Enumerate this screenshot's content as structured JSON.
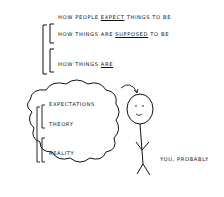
{
  "top_list": {
    "line1": {
      "pre": "How people ",
      "em": "expect",
      "post": " things to be"
    },
    "line2": {
      "pre": "How things are ",
      "em": "supposed",
      "post": " to be"
    },
    "line3": {
      "pre": "How things ",
      "em": "are",
      "post": ""
    }
  },
  "cloud_list": [
    "Expectations",
    "Theory",
    "Reality"
  ],
  "caption": "You, probably"
}
